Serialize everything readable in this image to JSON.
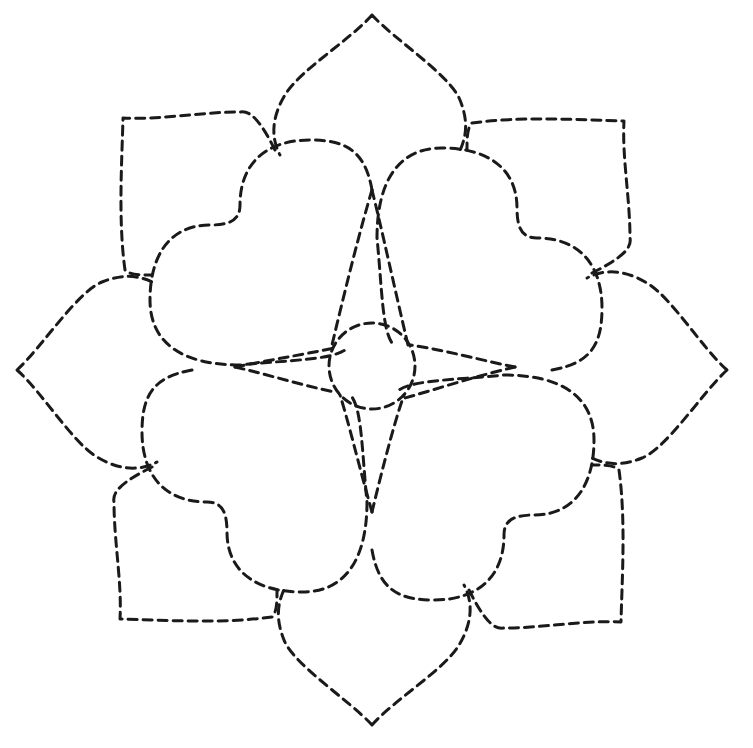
{
  "pattern": {
    "title": "Quilting stitch pattern",
    "line_color": "#1a1a1a",
    "background": "#ffffff",
    "components": [
      "outer-pointed-petals",
      "heart-petals",
      "center-circle",
      "diamond-rays"
    ]
  }
}
